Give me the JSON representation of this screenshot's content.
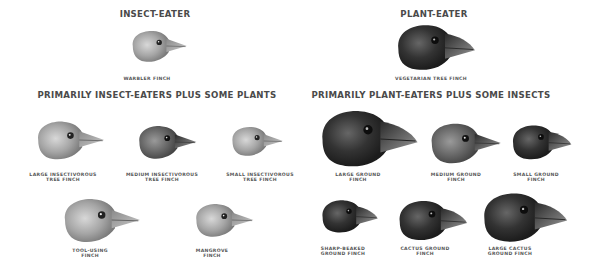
{
  "groups": {
    "insect_eater": {
      "heading": "INSECT-EATER",
      "birds": [
        {
          "name": "WARBLER FINCH",
          "line1": "WARBLER FINCH",
          "line2": ""
        }
      ]
    },
    "plant_eater": {
      "heading": "PLANT-EATER",
      "birds": [
        {
          "name": "VEGETARIAN TREE FINCH",
          "line1": "VEGETARIAN TREE FINCH",
          "line2": ""
        }
      ]
    },
    "insect_plus_plants": {
      "heading": "PRIMARILY INSECT-EATERS PLUS SOME PLANTS",
      "birds": [
        {
          "line1": "LARGE INSECTIVOROUS",
          "line2": "TREE FINCH"
        },
        {
          "line1": "MEDIUM INSECTIVOROUS",
          "line2": "TREE FINCH"
        },
        {
          "line1": "SMALL INSECTIVOROUS",
          "line2": "TREE FINCH"
        },
        {
          "line1": "TOOL-USING",
          "line2": "FINCH"
        },
        {
          "line1": "MANGROVE",
          "line2": "FINCH"
        }
      ]
    },
    "plant_plus_insects": {
      "heading": "PRIMARILY PLANT-EATERS PLUS SOME INSECTS",
      "birds": [
        {
          "line1": "LARGE GROUND",
          "line2": "FINCH"
        },
        {
          "line1": "MEDIUM GROUND",
          "line2": "FINCH"
        },
        {
          "line1": "SMALL GROUND",
          "line2": "FINCH"
        },
        {
          "line1": "SHARP-BEAKED",
          "line2": "GROUND FINCH"
        },
        {
          "line1": "CACTUS GROUND",
          "line2": "FINCH"
        },
        {
          "line1": "LARGE CACTUS",
          "line2": "GROUND FINCH"
        }
      ]
    }
  },
  "colors": {
    "background": "#ffffff",
    "text": "#4a4a4a",
    "light_bird": "#9a9a9a",
    "dark_bird": "#2e2e2e"
  }
}
